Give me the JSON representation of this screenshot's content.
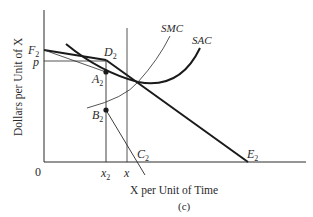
{
  "figure": {
    "caption": "(c)",
    "y_axis_label": "Dollars per Unit of X",
    "x_axis_label": "X per Unit of Time",
    "origin_label": "0"
  },
  "labels": {
    "F2": {
      "main": "F",
      "sub": "2"
    },
    "p": {
      "main": "p"
    },
    "D2": {
      "main": "D",
      "sub": "2"
    },
    "A2": {
      "main": "A",
      "sub": "2"
    },
    "B2": {
      "main": "B",
      "sub": "2"
    },
    "C2": {
      "main": "C",
      "sub": "2"
    },
    "E2": {
      "main": "E",
      "sub": "2"
    },
    "x2": {
      "main": "x",
      "sub": "2"
    },
    "x": {
      "main": "x"
    },
    "SMC": "SMC",
    "SAC": "SAC"
  },
  "colors": {
    "ink": "#2a2a2a",
    "background": "#ffffff"
  }
}
